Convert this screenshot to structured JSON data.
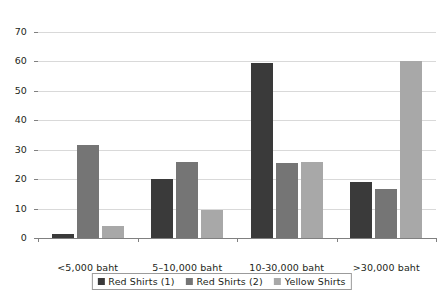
{
  "chart_data": {
    "type": "bar",
    "title": "",
    "subtitle": "",
    "xlabel": "",
    "ylabel": "",
    "ylim": [
      0,
      70
    ],
    "yticks": [
      0,
      10,
      20,
      30,
      40,
      50,
      60,
      70
    ],
    "grid": true,
    "legend_position": "bottom-center",
    "orientation": "vertical",
    "grouping": "clustered",
    "categories": [
      "<5,000 baht",
      "5–10,000 baht",
      "10-30,000 baht",
      ">30,000 baht"
    ],
    "series": [
      {
        "name": "Red Shirts (1)",
        "color": "#3a3a3a",
        "values": [
          1.5,
          20,
          59.5,
          19
        ]
      },
      {
        "name": "Red Shirts (2)",
        "color": "#757575",
        "values": [
          31.5,
          26,
          25.5,
          16.5
        ]
      },
      {
        "name": "Yellow Shirts",
        "color": "#a8a8a8",
        "values": [
          4,
          9.5,
          26,
          60
        ]
      }
    ]
  },
  "style": {
    "gridline_color": "#d9d9d9",
    "axis_color": "#808080",
    "text_color": "#231f20",
    "background": "#ffffff",
    "legend_border": "#9b9b9b"
  }
}
